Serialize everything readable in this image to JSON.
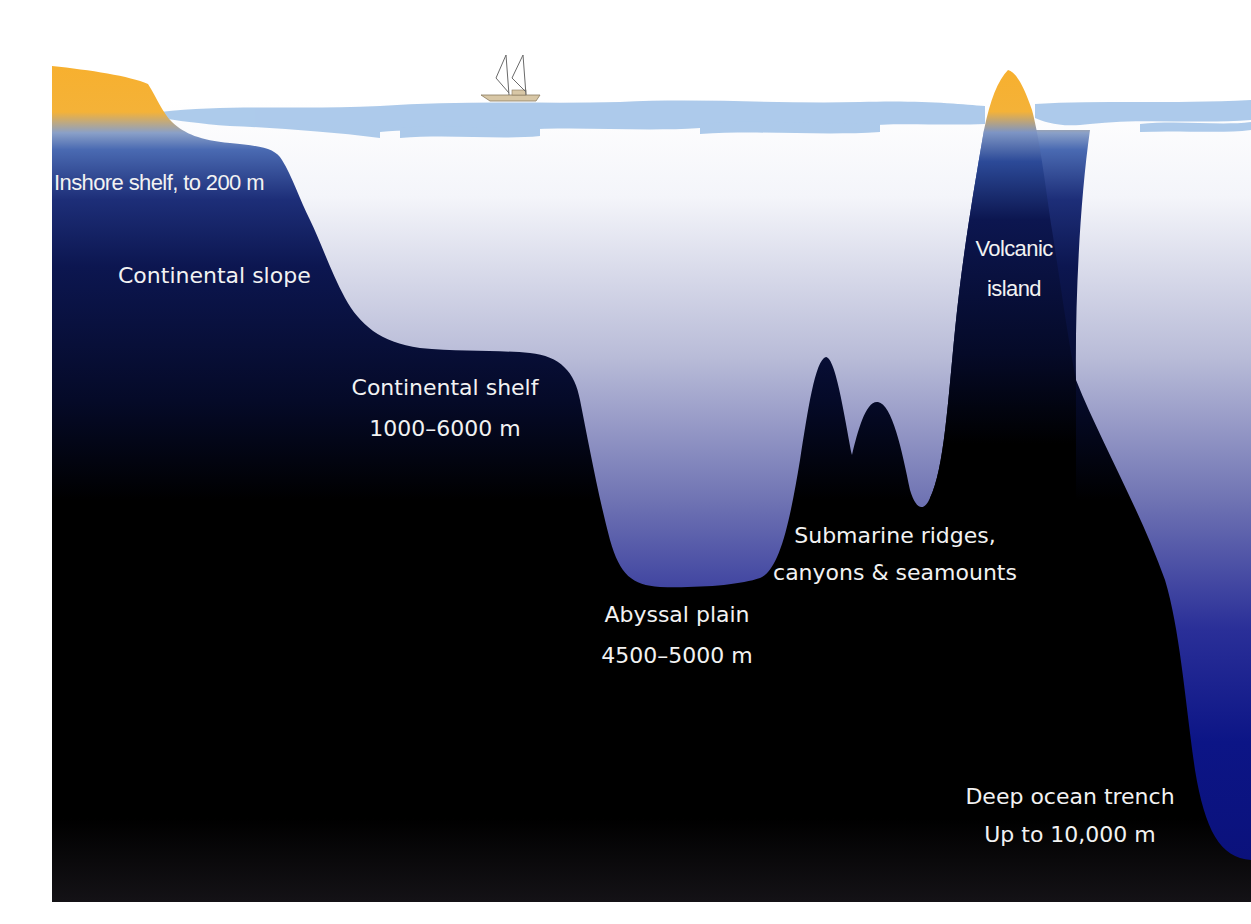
{
  "diagram": {
    "type": "ocean floor cross-section",
    "colors": {
      "land": "#f5b233",
      "surface_water": "#a9c8ea",
      "shallow_blue": "#3a5aa6",
      "deep_navy": "#0b1448",
      "seabed": "#000000",
      "water_gradient_top": "#ffffff",
      "water_gradient_bottom": "#0a1280",
      "label_text": "#f2f2f2"
    },
    "features": [
      {
        "id": "inshore-shelf",
        "lines": [
          "Inshore shelf, to 200 m"
        ]
      },
      {
        "id": "continental-slope",
        "lines": [
          "Continental slope"
        ]
      },
      {
        "id": "continental-shelf",
        "lines": [
          "Continental shelf",
          "1000–6000 m"
        ]
      },
      {
        "id": "abyssal-plain",
        "lines": [
          "Abyssal plain",
          "4500–5000 m"
        ]
      },
      {
        "id": "submarine-ridges",
        "lines": [
          "Submarine ridges,",
          "canyons & seamounts"
        ]
      },
      {
        "id": "volcanic-island",
        "lines": [
          "Volcanic",
          "island"
        ]
      },
      {
        "id": "deep-ocean-trench",
        "lines": [
          "Deep ocean trench",
          "Up to 10,000 m"
        ]
      }
    ],
    "icons": {
      "boat": "sailboat-icon"
    }
  }
}
